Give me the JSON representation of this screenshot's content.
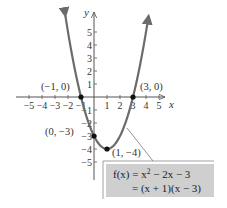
{
  "chart_data": {
    "type": "line",
    "title": "",
    "xlabel": "x",
    "ylabel": "y",
    "xlim": [
      -5,
      5
    ],
    "ylim": [
      -5,
      5
    ],
    "grid": false,
    "x_ticks": [
      -5,
      -4,
      -3,
      -2,
      -1,
      1,
      2,
      3,
      4,
      5
    ],
    "y_ticks": [
      -5,
      -4,
      -3,
      -2,
      -1,
      1,
      2,
      3,
      4,
      5
    ],
    "x_tick_labels": [
      "−5",
      "−4",
      "−3",
      "−2",
      "−1",
      "1",
      "2",
      "3",
      "4",
      "5"
    ],
    "y_tick_labels": [
      "−5",
      "−4",
      "−3",
      "−2",
      "−1",
      "1",
      "2",
      "3",
      "4",
      "5"
    ],
    "series": [
      {
        "name": "f(x) = x^2 - 2x - 3",
        "function": "x^2 - 2x - 3",
        "x_range": [
          -2.2,
          4.2
        ],
        "color": "#6b6b6b"
      }
    ],
    "points": [
      {
        "x": -1,
        "y": 0,
        "label": "(−1, 0)"
      },
      {
        "x": 3,
        "y": 0,
        "label": "(3, 0)"
      },
      {
        "x": 0,
        "y": -3,
        "label": "(0, −3)"
      },
      {
        "x": 1,
        "y": -4,
        "label": "(1, −4)"
      }
    ],
    "annotation": {
      "line1": "f(x) = x² − 2x − 3",
      "line2": "= (x + 1)(x − 3)",
      "box_color": "#cfcfcf"
    }
  },
  "labels": {
    "x_axis": "x",
    "y_axis": "y",
    "pt_neg1_0": "(−1, 0)",
    "pt_3_0": "(3, 0)",
    "pt_0_neg3": "(0, −3)",
    "pt_1_neg4": "(1, −4)",
    "fn_line1_lhs": "f(x) = x",
    "fn_line1_exp": "2",
    "fn_line1_rhs": " − 2x − 3",
    "fn_line2": "= (x + 1)(x − 3)"
  }
}
